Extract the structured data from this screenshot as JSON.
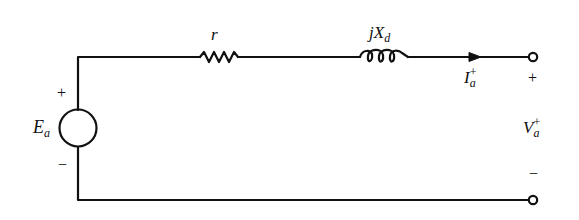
{
  "diagram": {
    "type": "circuit",
    "stroke_color": "#111111",
    "background": "#ffffff",
    "components": {
      "source": {
        "symbol": "E",
        "subscript": "a",
        "plus": "+",
        "minus": "−"
      },
      "resistor": {
        "label": "r"
      },
      "inductor": {
        "label_j": "j",
        "label_x": "X",
        "subscript": "d"
      },
      "current": {
        "symbol": "I",
        "subscript": "a",
        "superscript": "+"
      },
      "terminal_voltage": {
        "symbol": "V",
        "subscript": "a",
        "superscript": "+",
        "plus": "+",
        "minus": "−"
      }
    }
  }
}
